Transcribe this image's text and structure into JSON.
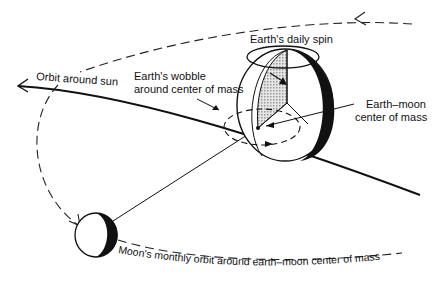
{
  "diagram": {
    "type": "earth-moon-system",
    "labels": {
      "orbit_sun": "Orbit around sun",
      "wobble_line1": "Earth's wobble",
      "wobble_line2": "around center of mass",
      "daily_spin": "Earth's daily spin",
      "com_line1": "Earth–moon",
      "com_line2": "center of mass",
      "moon_orbit": "Moon's monthly orbit around earth–moon center of mass"
    },
    "elements": [
      "earth",
      "moon",
      "sun-orbit-path",
      "moon-orbit-path",
      "wobble-ellipse",
      "spin-ring",
      "center-of-mass-point"
    ],
    "colors": {
      "ink": "#111111",
      "background": "#ffffff",
      "hatch": "#bbbbbb"
    }
  }
}
